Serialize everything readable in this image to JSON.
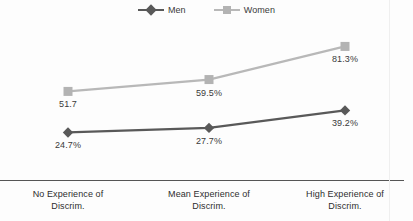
{
  "chart_data": {
    "type": "line",
    "title": "",
    "subtitle": "",
    "xlabel": "",
    "ylabel": "",
    "grid": false,
    "legend_position": "top-center",
    "categories": [
      "No Experience of Discrim.",
      "Mean Experience of Discrim.",
      "High Experience of Discrim."
    ],
    "category_lines": [
      [
        "No Experience of",
        "Discrim."
      ],
      [
        "Mean Experience of",
        "Discrim."
      ],
      [
        "High Experience of",
        "Discrim."
      ]
    ],
    "ylim": [
      0,
      100
    ],
    "series": [
      {
        "name": "Men",
        "color": "#595959",
        "marker": "diamond",
        "values": [
          24.7,
          27.7,
          39.2
        ],
        "labels": [
          "24.7%",
          "27.7%",
          "39.2%"
        ]
      },
      {
        "name": "Women",
        "color": "#b3b3b3",
        "marker": "square",
        "values": [
          51.7,
          59.5,
          81.3
        ],
        "labels": [
          "51.7",
          "59.5%",
          "81.3%"
        ]
      }
    ]
  },
  "legend": {
    "items": [
      {
        "label": "Men",
        "color": "#595959",
        "marker": "diamond-marker"
      },
      {
        "label": "Women",
        "color": "#b3b3b3",
        "marker": "square-marker"
      }
    ]
  },
  "axis": {
    "baseline_color": "#555555"
  }
}
